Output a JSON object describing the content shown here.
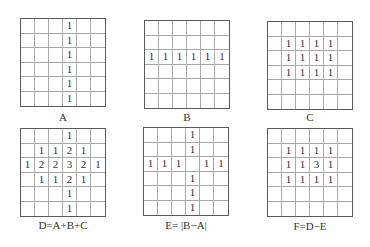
{
  "panels": [
    {
      "id": "A",
      "label": "A",
      "x": 20,
      "y": 18,
      "label_y": 111,
      "cells": [
        [
          "",
          "",
          "",
          "1",
          "",
          ""
        ],
        [
          "",
          "",
          "",
          "1",
          "",
          ""
        ],
        [
          "",
          "",
          "",
          "1",
          "",
          ""
        ],
        [
          "",
          "",
          "",
          "1",
          "",
          ""
        ],
        [
          "",
          "",
          "",
          "1",
          "",
          ""
        ],
        [
          "",
          "",
          "",
          "1",
          "",
          ""
        ]
      ]
    },
    {
      "id": "B",
      "label": "B",
      "x": 144,
      "y": 20,
      "label_y": 111,
      "cells": [
        [
          "",
          "",
          "",
          "",
          "",
          ""
        ],
        [
          "",
          "",
          "",
          "",
          "",
          ""
        ],
        [
          "1",
          "1",
          "1",
          "1",
          "1",
          "1"
        ],
        [
          "",
          "",
          "",
          "",
          "",
          ""
        ],
        [
          "",
          "",
          "",
          "",
          "",
          ""
        ],
        [
          "",
          "",
          "",
          "",
          "",
          ""
        ]
      ]
    },
    {
      "id": "C",
      "label": "C",
      "x": 267,
      "y": 21,
      "label_y": 111,
      "cells": [
        [
          "",
          "",
          "",
          "",
          "",
          ""
        ],
        [
          "",
          "1",
          "1",
          "1",
          "1",
          ""
        ],
        [
          "",
          "1",
          "1",
          "1",
          "1",
          ""
        ],
        [
          "",
          "1",
          "1",
          "1",
          "1",
          ""
        ],
        [
          "",
          "",
          "",
          "",
          "",
          ""
        ],
        [
          "",
          "",
          "",
          "",
          "",
          ""
        ]
      ]
    },
    {
      "id": "D",
      "label": "D=A+B+C",
      "x": 20,
      "y": 128,
      "label_y": 219,
      "cells": [
        [
          "",
          "",
          "",
          "1",
          "",
          ""
        ],
        [
          "",
          "1",
          "1",
          "2",
          "1",
          ""
        ],
        [
          "1",
          "2",
          "2",
          "3",
          "2",
          "1"
        ],
        [
          "",
          "1",
          "1",
          "2",
          "1",
          ""
        ],
        [
          "",
          "",
          "",
          "1",
          "",
          ""
        ],
        [
          "",
          "",
          "",
          "1",
          "",
          ""
        ]
      ]
    },
    {
      "id": "E",
      "label": "E= |B−A|",
      "x": 143,
      "y": 127,
      "label_y": 219,
      "cells": [
        [
          "",
          "",
          "",
          "1",
          "",
          ""
        ],
        [
          "",
          "",
          "",
          "1",
          "",
          ""
        ],
        [
          "1",
          "1",
          "1",
          "",
          "1",
          "1"
        ],
        [
          "",
          "",
          "",
          "1",
          "",
          ""
        ],
        [
          "",
          "",
          "",
          "1",
          "",
          ""
        ],
        [
          "",
          "",
          "",
          "1",
          "",
          ""
        ]
      ]
    },
    {
      "id": "F",
      "label": "F=D−E",
      "x": 267,
      "y": 128,
      "label_y": 220,
      "cells": [
        [
          "",
          "",
          "",
          "",
          "",
          ""
        ],
        [
          "",
          "1",
          "1",
          "1",
          "1",
          ""
        ],
        [
          "",
          "1",
          "1",
          "3",
          "1",
          ""
        ],
        [
          "",
          "1",
          "1",
          "1",
          "1",
          ""
        ],
        [
          "",
          "",
          "",
          "",
          "",
          ""
        ],
        [
          "",
          "",
          "",
          "",
          "",
          ""
        ]
      ]
    }
  ]
}
